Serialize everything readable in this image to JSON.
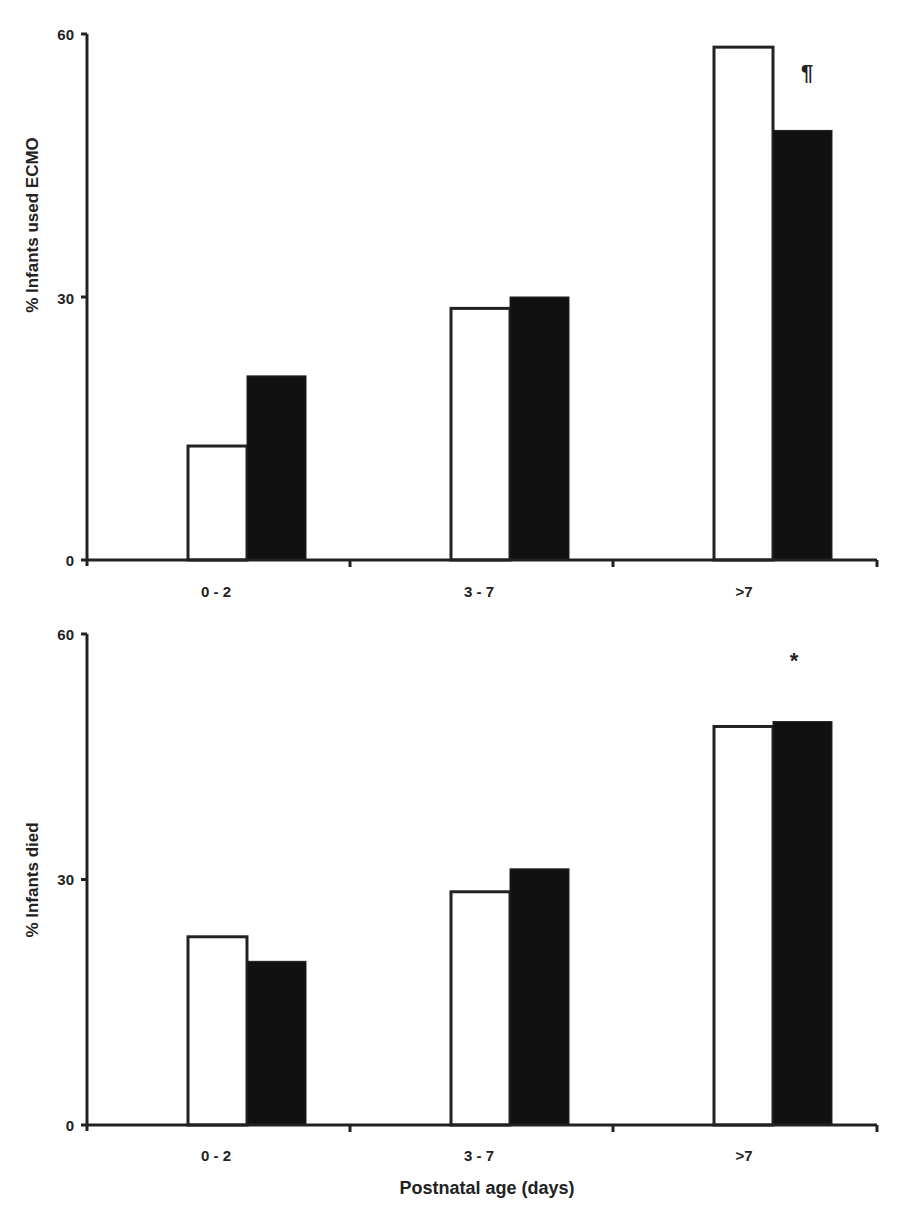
{
  "chart_data": [
    {
      "type": "bar",
      "title": "",
      "xlabel": "",
      "ylabel": "% Infants used ECMO",
      "categories": [
        "0 - 2",
        "3 - 7",
        ">7"
      ],
      "series": [
        {
          "name": "Group A (open bars)",
          "fill": "#ffffff",
          "values": [
            13,
            28.7,
            58.5
          ]
        },
        {
          "name": "Group B (filled bars)",
          "fill": "#111111",
          "values": [
            21,
            30,
            49
          ]
        }
      ],
      "ylim": [
        0,
        60
      ],
      "yticks": [
        0,
        30,
        60
      ],
      "grid": false,
      "legend": "none",
      "annotations": [
        {
          "text": "¶",
          "category": ">7",
          "y": 56
        }
      ]
    },
    {
      "type": "bar",
      "title": "",
      "xlabel": "Postnatal age (days)",
      "ylabel": "% Infants died",
      "categories": [
        "0 - 2",
        "3 - 7",
        ">7"
      ],
      "series": [
        {
          "name": "Group A (open bars)",
          "fill": "#ffffff",
          "values": [
            23,
            28.5,
            48.7
          ]
        },
        {
          "name": "Group B (filled bars)",
          "fill": "#111111",
          "values": [
            20,
            31.3,
            49.3
          ]
        }
      ],
      "ylim": [
        0,
        60
      ],
      "yticks": [
        0,
        30,
        60
      ],
      "grid": false,
      "legend": "none",
      "annotations": [
        {
          "text": "*",
          "category": ">7",
          "y": 57
        }
      ]
    }
  ],
  "panels": [
    {
      "ylabel": "% Infants used ECMO",
      "x_tick_labels": [
        "0 - 2",
        "3 - 7",
        ">7"
      ],
      "y_tick_labels": [
        "0",
        "30",
        "60"
      ],
      "annotation": "¶"
    },
    {
      "ylabel": "% Infants died",
      "x_tick_labels": [
        "0 - 2",
        "3 - 7",
        ">7"
      ],
      "y_tick_labels": [
        "0",
        "30",
        "60"
      ],
      "annotation": "*",
      "xlabel": "Postnatal age (days)"
    }
  ],
  "colors": {
    "axis": "#222222",
    "bar_open_fill": "#ffffff",
    "bar_filled": "#111111",
    "bar_outline": "#222222"
  }
}
